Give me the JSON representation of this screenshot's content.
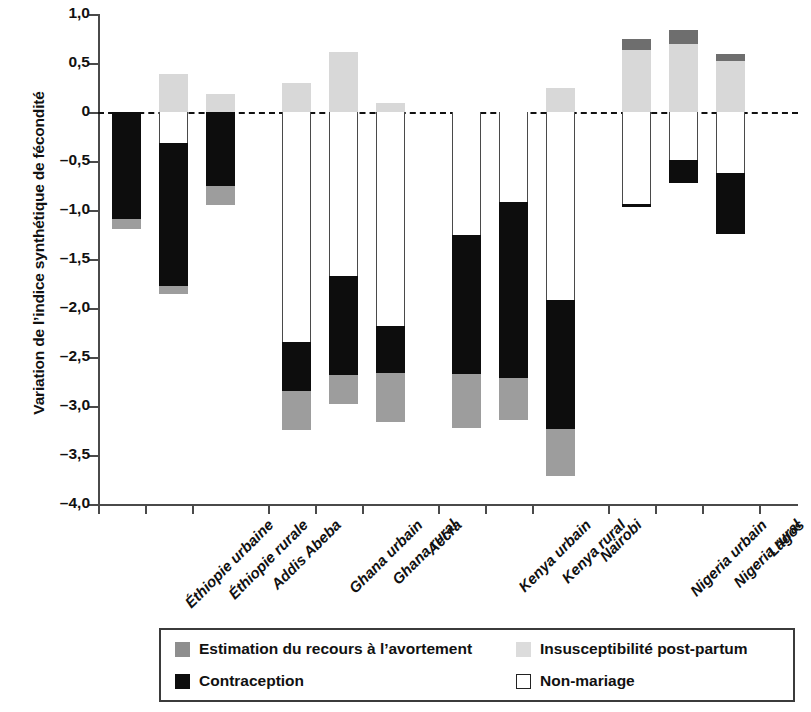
{
  "chart_data": {
    "type": "bar",
    "title": "",
    "xlabel": "",
    "ylabel": "Variation de l’indice synthétique de fécondité",
    "ylim": [
      -4.0,
      1.0
    ],
    "ytick_labels": [
      "1,0",
      "0,5",
      "0",
      "–0,5",
      "–1,0",
      "–1,5",
      "–2,0",
      "–2,5",
      "–3,0",
      "–3,5",
      "–4,0"
    ],
    "ytick_values": [
      1.0,
      0.5,
      0,
      -0.5,
      -1.0,
      -1.5,
      -2.0,
      -2.5,
      -3.0,
      -3.5,
      -4.0
    ],
    "grid": false,
    "zero_reference_line": true,
    "legend_position": "bottom",
    "stacked": true,
    "categories": [
      "Éthiopie urbaine",
      "Éthiopie rurale",
      "Addis Abeba",
      "Ghana urbain",
      "Ghana rural",
      "Accra",
      "Kenya urbain",
      "Kenya rural",
      "Nairobi",
      "Nigeria urbain",
      "Nigeria rural",
      "Lagos"
    ],
    "group_breaks_after": [
      "Addis Abeba",
      "Accra",
      "Nairobi"
    ],
    "series": [
      {
        "name": "Estimation du recours à l’avortement",
        "color": "#8e8e8e",
        "values": [
          -0.1,
          -0.08,
          -0.19,
          -0.4,
          -0.3,
          -0.5,
          -0.55,
          -0.43,
          -0.48,
          0.12,
          0.15,
          0.07
        ]
      },
      {
        "name": "Insusceptibilité post-partum",
        "color": "#dcdcdc",
        "values": [
          0.0,
          0.39,
          0.18,
          0.3,
          0.61,
          0.09,
          0.0,
          0.0,
          0.25,
          0.63,
          0.69,
          0.52
        ]
      },
      {
        "name": "Contraception",
        "color": "#0d0d0d",
        "values": [
          -1.09,
          -1.46,
          -0.76,
          -0.5,
          -1.01,
          -0.48,
          -1.42,
          -1.79,
          -1.31,
          -0.03,
          -0.23,
          -0.62
        ]
      },
      {
        "name": "Non-mariage",
        "color": "#ffffff",
        "values": [
          0.0,
          -0.32,
          0.0,
          -2.35,
          -1.67,
          -2.18,
          -1.25,
          -0.92,
          -1.92,
          -0.94,
          -0.49,
          -0.62
        ]
      }
    ],
    "bar_totals": [
      -1.19,
      -1.86,
      -0.95,
      -3.25,
      -2.98,
      -3.16,
      -3.22,
      -3.14,
      -3.71,
      -0.97,
      -0.72,
      -1.24
    ],
    "bars": [
      {
        "label": "Éthiopie urbaine",
        "dark_gray_top": 0.0,
        "light_gray_top": 0.0,
        "white_from": 0.0,
        "white_to": 0.0,
        "black_from": 0.0,
        "black_to": -1.09,
        "gray_from": -1.09,
        "gray_to": -1.19
      },
      {
        "label": "Éthiopie rurale",
        "dark_gray_top": 0.0,
        "light_gray_top": 0.39,
        "white_from": 0.0,
        "white_to": -0.32,
        "black_from": -0.32,
        "black_to": -1.78,
        "gray_from": -1.78,
        "gray_to": -1.86
      },
      {
        "label": "Addis Abeba",
        "dark_gray_top": 0.0,
        "light_gray_top": 0.18,
        "white_from": 0.0,
        "white_to": 0.0,
        "black_from": 0.0,
        "black_to": -0.76,
        "gray_from": -0.76,
        "gray_to": -0.95
      },
      {
        "label": "Ghana urbain",
        "dark_gray_top": 0.0,
        "light_gray_top": 0.3,
        "white_from": 0.0,
        "white_to": -2.35,
        "black_from": -2.35,
        "black_to": -2.85,
        "gray_from": -2.85,
        "gray_to": -3.25
      },
      {
        "label": "Ghana rural",
        "dark_gray_top": 0.0,
        "light_gray_top": 0.61,
        "white_from": 0.0,
        "white_to": -1.67,
        "black_from": -1.67,
        "black_to": -2.68,
        "gray_from": -2.68,
        "gray_to": -2.98
      },
      {
        "label": "Accra",
        "dark_gray_top": 0.0,
        "light_gray_top": 0.09,
        "white_from": 0.0,
        "white_to": -2.18,
        "black_from": -2.18,
        "black_to": -2.66,
        "gray_from": -2.66,
        "gray_to": -3.16
      },
      {
        "label": "Kenya urbain",
        "dark_gray_top": 0.0,
        "light_gray_top": 0.0,
        "white_from": 0.0,
        "white_to": -1.25,
        "black_from": -1.25,
        "black_to": -2.67,
        "gray_from": -2.67,
        "gray_to": -3.22
      },
      {
        "label": "Kenya rural",
        "dark_gray_top": 0.0,
        "light_gray_top": 0.0,
        "white_from": 0.0,
        "white_to": -0.92,
        "black_from": -0.92,
        "black_to": -2.71,
        "gray_from": -2.71,
        "gray_to": -3.14
      },
      {
        "label": "Nairobi",
        "dark_gray_top": 0.0,
        "light_gray_top": 0.25,
        "white_from": 0.0,
        "white_to": -1.92,
        "black_from": -1.92,
        "black_to": -3.23,
        "gray_from": -3.23,
        "gray_to": -3.71
      },
      {
        "label": "Nigeria urbain",
        "dark_gray_top": 0.75,
        "light_gray_top": 0.63,
        "white_from": 0.0,
        "white_to": -0.94,
        "black_from": -0.94,
        "black_to": -0.97,
        "gray_from": 0.0,
        "gray_to": 0.0
      },
      {
        "label": "Nigeria rural",
        "dark_gray_top": 0.84,
        "light_gray_top": 0.69,
        "white_from": 0.0,
        "white_to": -0.49,
        "black_from": -0.49,
        "black_to": -0.72,
        "gray_from": 0.0,
        "gray_to": 0.0
      },
      {
        "label": "Lagos",
        "dark_gray_top": 0.59,
        "light_gray_top": 0.52,
        "white_from": 0.0,
        "white_to": -0.62,
        "black_from": -0.62,
        "black_to": -1.24,
        "gray_from": 0.0,
        "gray_to": 0.0
      }
    ]
  },
  "legend": {
    "items": [
      {
        "label": "Estimation du recours à l’avortement",
        "swatch": "gray"
      },
      {
        "label": "Insusceptibilité post-partum",
        "swatch": "light"
      },
      {
        "label": "Contraception",
        "swatch": "black"
      },
      {
        "label": "Non-mariage",
        "swatch": "white"
      }
    ]
  }
}
